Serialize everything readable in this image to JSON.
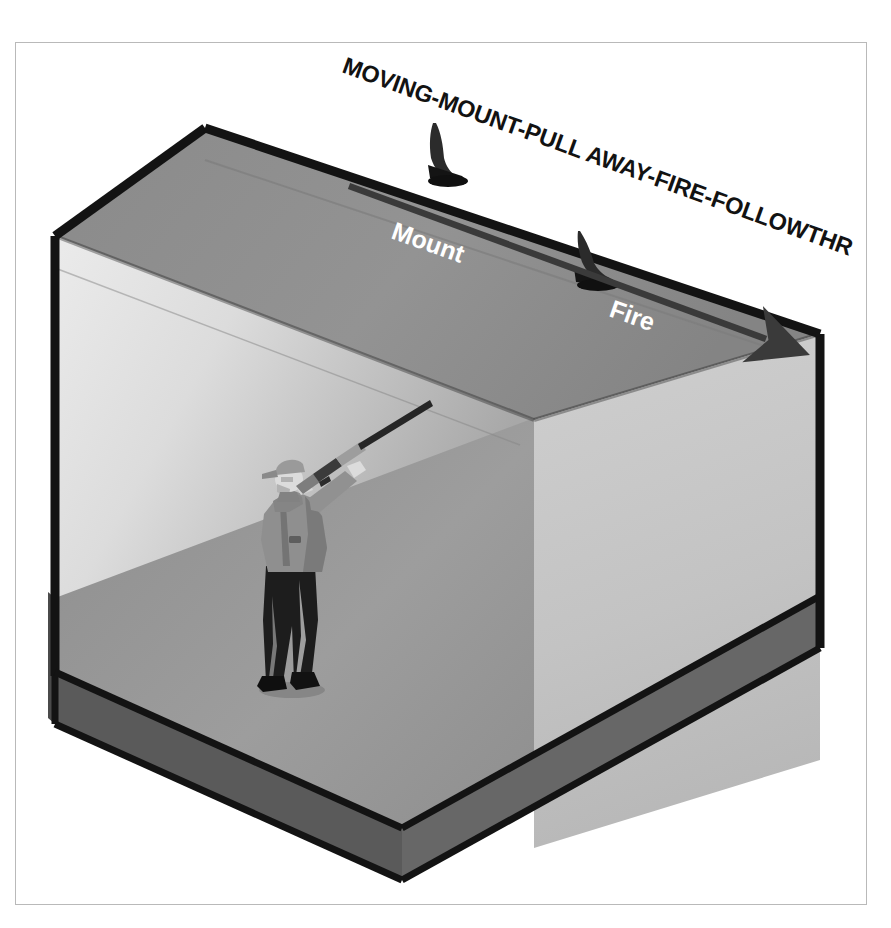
{
  "diagram": {
    "title": "MOVING-MOUNT-PULL AWAY-FIRE-FOLLOWTHROUGH",
    "title_rotation_deg": 19.5,
    "labels": {
      "mount": "Mount",
      "fire": "Fire"
    },
    "arrow": {
      "name": "swing-arrow",
      "direction": "down-right",
      "from_label": "Mount",
      "to_label": "Fire"
    },
    "targets": [
      {
        "name": "clay-target-mount",
        "label_association": "Mount"
      },
      {
        "name": "clay-target-fire",
        "label_association": "Fire"
      }
    ],
    "figure": {
      "name": "shooter",
      "description": "shooter with mounted shotgun",
      "wears_cap": true
    },
    "colors": {
      "page_background": "#ffffff",
      "frame_border": "#b9b9b9",
      "back_wall_light": "#e3e3e3",
      "back_wall_dark": "#b4b4b4",
      "right_wall": "#c3c3c3",
      "ceiling": "#8c8c8c",
      "floor": "#9a9a9a",
      "base_front": "#636363",
      "base_side": "#4f4f4f",
      "edge_dark": "#151515",
      "label_text": "#ffffff",
      "title_text": "#121212",
      "arrow": "#3a3a3a",
      "target_dark": "#1b1b1b",
      "shooter_shirt": "#8e8e8e",
      "shooter_pants": "#1e1e1e",
      "shooter_skin": "#d8d8d8",
      "gun_barrel": "#2a2a2a"
    }
  }
}
